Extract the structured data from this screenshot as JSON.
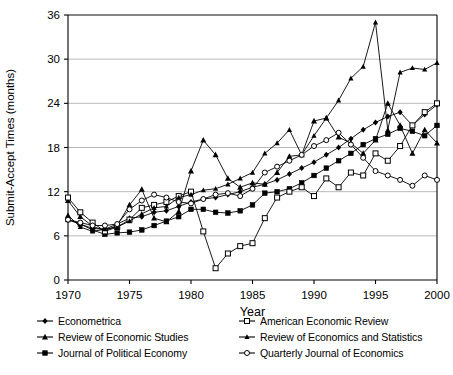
{
  "chart_data": {
    "type": "line",
    "title": "",
    "xlabel": "Year",
    "ylabel": "Submit-Accept Times (months)",
    "xlim": [
      1970,
      2000
    ],
    "ylim": [
      0,
      36
    ],
    "xticks": [
      1970,
      1975,
      1980,
      1985,
      1990,
      1995,
      2000
    ],
    "yticks": [
      0,
      6,
      12,
      18,
      24,
      30,
      36
    ],
    "grid": "horizontal",
    "legend_position": "bottom",
    "x": [
      1970,
      1971,
      1972,
      1973,
      1974,
      1975,
      1976,
      1977,
      1978,
      1979,
      1980,
      1981,
      1982,
      1983,
      1984,
      1985,
      1986,
      1987,
      1988,
      1989,
      1990,
      1991,
      1992,
      1993,
      1994,
      1995,
      1996,
      1997,
      1998,
      1999,
      2000
    ],
    "series": [
      {
        "name": "Econometrica",
        "marker": "filled-diamond",
        "values": [
          8.2,
          7.6,
          7.0,
          6.9,
          7.6,
          8.4,
          8.6,
          9.2,
          9.4,
          10.0,
          10.6,
          11.0,
          11.2,
          11.6,
          12.0,
          12.6,
          13.0,
          13.6,
          14.4,
          15.2,
          16.0,
          17.0,
          18.0,
          19.2,
          20.4,
          21.4,
          22.2,
          22.8,
          21.0,
          22.5,
          23.8
        ]
      },
      {
        "name": "Review of Economic Studies",
        "marker": "filled-triangle",
        "values": [
          10.8,
          8.6,
          7.3,
          6.7,
          7.4,
          10.2,
          12.3,
          8.4,
          7.9,
          9.3,
          14.8,
          19.0,
          17.0,
          13.8,
          12.6,
          13.2,
          13.0,
          14.6,
          16.8,
          17.0,
          21.6,
          22.0,
          19.4,
          18.6,
          17.2,
          19.0,
          24.0,
          21.0,
          17.2,
          20.4,
          18.6
        ]
      },
      {
        "name": "Journal of Political Economy",
        "marker": "filled-square",
        "values": [
          8.2,
          7.6,
          6.8,
          6.2,
          6.4,
          6.5,
          6.8,
          7.4,
          8.0,
          8.6,
          9.6,
          9.6,
          9.2,
          9.1,
          9.4,
          10.2,
          11.8,
          12.0,
          12.4,
          13.2,
          14.2,
          15.2,
          16.2,
          17.2,
          18.4,
          19.2,
          19.8,
          20.6,
          20.2,
          19.6,
          21.0
        ]
      },
      {
        "name": "American Economic Review",
        "marker": "open-square",
        "values": [
          11.2,
          9.2,
          7.8,
          6.6,
          7.2,
          8.2,
          9.8,
          10.2,
          10.6,
          11.4,
          12.0,
          6.6,
          1.6,
          3.6,
          4.6,
          5.0,
          8.4,
          11.2,
          12.0,
          12.6,
          11.4,
          13.8,
          12.6,
          14.6,
          14.2,
          17.2,
          16.2,
          18.2,
          21.0,
          22.8,
          24.0
        ]
      },
      {
        "name": "Review of Economics and Statistics",
        "marker": "filled-triangle-small",
        "values": [
          8.8,
          7.2,
          6.6,
          6.9,
          7.2,
          8.0,
          9.0,
          9.8,
          10.0,
          11.2,
          11.6,
          12.2,
          12.4,
          13.0,
          13.8,
          14.6,
          17.2,
          18.6,
          20.4,
          17.0,
          19.6,
          22.0,
          24.4,
          27.4,
          29.0,
          35.0,
          20.4,
          28.2,
          28.8,
          28.6,
          29.5
        ]
      },
      {
        "name": "Quarterly Journal of Economics",
        "marker": "open-circle",
        "values": [
          8.2,
          7.8,
          7.4,
          7.4,
          7.6,
          9.6,
          10.8,
          11.6,
          11.2,
          10.6,
          10.4,
          11.0,
          11.6,
          11.8,
          11.4,
          12.4,
          14.6,
          15.4,
          16.2,
          17.0,
          18.2,
          19.0,
          20.0,
          18.4,
          16.6,
          14.8,
          14.2,
          13.6,
          12.8,
          14.2,
          13.6
        ]
      }
    ]
  },
  "legend": {
    "left_items": [
      "Econometrica",
      "Review of Economic Studies",
      "Journal of Political Economy"
    ],
    "right_items": [
      "American Economic Review",
      "Review of Economics and Statistics",
      "Quarterly Journal of Economics"
    ]
  },
  "colors": {
    "line": "#000000",
    "grid": "#a8a8a8",
    "axis": "#000000",
    "background": "#ffffff"
  }
}
